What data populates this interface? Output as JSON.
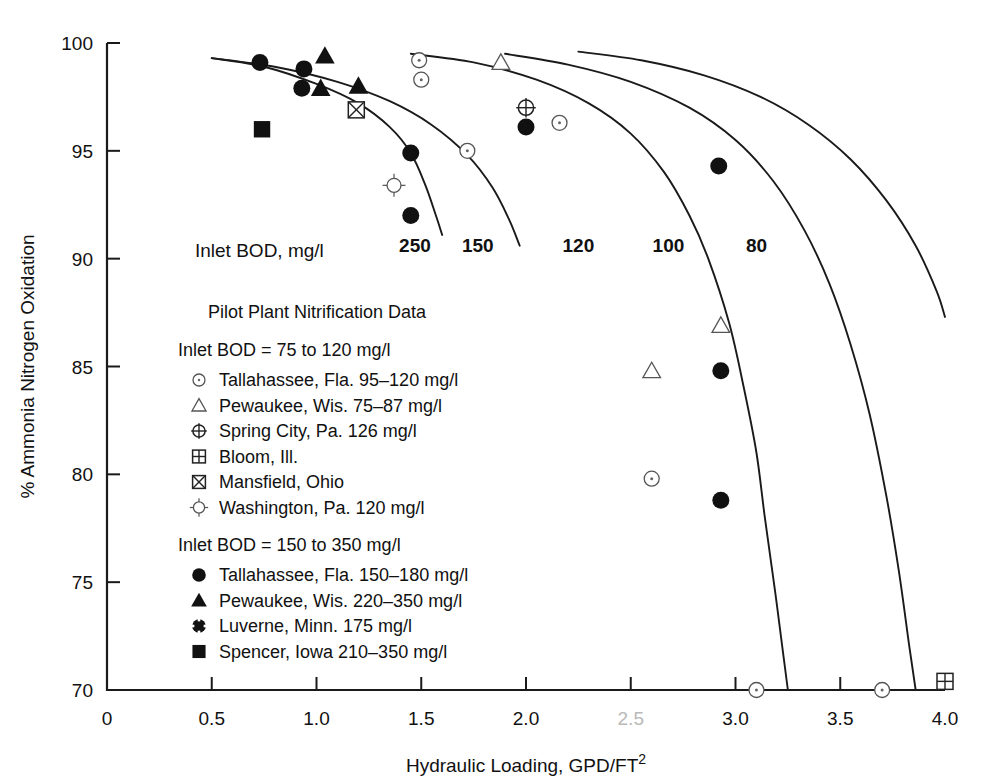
{
  "chart_data": {
    "type": "scatter",
    "title": "",
    "xlabel": "Hydraulic Loading, GPD/FT2",
    "xlabel_main": "Hydraulic Loading, GPD/FT",
    "xlabel_sup": "2",
    "ylabel": "% Ammonia Nitrogen Oxidation",
    "xlim": [
      0,
      4.0
    ],
    "ylim": [
      70,
      100
    ],
    "grid": false,
    "legend_position": "inside-left",
    "xticks": [
      {
        "value": 0,
        "label": "0",
        "faded": false
      },
      {
        "value": 0.5,
        "label": "0.5",
        "faded": false
      },
      {
        "value": 1.0,
        "label": "1.0",
        "faded": false
      },
      {
        "value": 1.5,
        "label": "1.5",
        "faded": false
      },
      {
        "value": 2.0,
        "label": "2.0",
        "faded": false
      },
      {
        "value": 2.5,
        "label": "2.5",
        "faded": true
      },
      {
        "value": 3.0,
        "label": "3.0",
        "faded": false
      },
      {
        "value": 3.5,
        "label": "3.5",
        "faded": false
      },
      {
        "value": 4.0,
        "label": "4.0",
        "faded": false
      }
    ],
    "yticks": [
      {
        "value": 70,
        "label": "70"
      },
      {
        "value": 75,
        "label": "75"
      },
      {
        "value": 80,
        "label": "80"
      },
      {
        "value": 85,
        "label": "85"
      },
      {
        "value": 90,
        "label": "90"
      },
      {
        "value": 95,
        "label": "95"
      },
      {
        "value": 100,
        "label": "100"
      }
    ],
    "curve_caption": "Inlet BOD, mg/l",
    "curves": [
      {
        "name": "250",
        "label": "250",
        "label_pos": {
          "x": 1.47,
          "y": 90.3
        },
        "points": [
          [
            0.5,
            99.3
          ],
          [
            0.75,
            98.9
          ],
          [
            1.0,
            98.1
          ],
          [
            1.2,
            97.2
          ],
          [
            1.35,
            96.1
          ],
          [
            1.45,
            94.9
          ],
          [
            1.52,
            93.4
          ],
          [
            1.57,
            92.0
          ],
          [
            1.6,
            91.1
          ]
        ]
      },
      {
        "name": "150",
        "label": "150",
        "label_pos": {
          "x": 1.77,
          "y": 90.3
        },
        "points": [
          [
            0.5,
            99.3
          ],
          [
            0.8,
            98.9
          ],
          [
            1.1,
            98.2
          ],
          [
            1.35,
            97.3
          ],
          [
            1.55,
            96.2
          ],
          [
            1.72,
            94.8
          ],
          [
            1.84,
            93.3
          ],
          [
            1.92,
            91.8
          ],
          [
            1.97,
            90.6
          ]
        ]
      },
      {
        "name": "120",
        "label": "120",
        "label_pos": {
          "x": 2.25,
          "y": 90.3
        },
        "points": [
          [
            1.45,
            99.5
          ],
          [
            1.75,
            99.1
          ],
          [
            2.05,
            98.3
          ],
          [
            2.3,
            97.2
          ],
          [
            2.5,
            95.8
          ],
          [
            2.66,
            94.0
          ],
          [
            2.78,
            92.0
          ],
          [
            2.87,
            90.0
          ],
          [
            2.97,
            87.0
          ],
          [
            3.04,
            84.0
          ],
          [
            3.1,
            81.0
          ],
          [
            3.14,
            78.0
          ],
          [
            3.19,
            74.5
          ],
          [
            3.23,
            71.5
          ],
          [
            3.25,
            70.0
          ]
        ]
      },
      {
        "name": "100",
        "label": "100",
        "label_pos": {
          "x": 2.68,
          "y": 90.3
        },
        "points": [
          [
            1.9,
            99.5
          ],
          [
            2.2,
            99.0
          ],
          [
            2.5,
            98.2
          ],
          [
            2.78,
            97.0
          ],
          [
            3.0,
            95.5
          ],
          [
            3.18,
            93.6
          ],
          [
            3.33,
            91.3
          ],
          [
            3.45,
            88.8
          ],
          [
            3.55,
            86.0
          ],
          [
            3.64,
            82.8
          ],
          [
            3.72,
            79.0
          ],
          [
            3.78,
            75.5
          ],
          [
            3.83,
            72.0
          ],
          [
            3.86,
            70.0
          ]
        ]
      },
      {
        "name": "80",
        "label": "80",
        "label_pos": {
          "x": 3.1,
          "y": 90.3
        },
        "points": [
          [
            2.25,
            99.6
          ],
          [
            2.55,
            99.2
          ],
          [
            2.85,
            98.5
          ],
          [
            3.12,
            97.5
          ],
          [
            3.35,
            96.2
          ],
          [
            3.55,
            94.6
          ],
          [
            3.72,
            92.7
          ],
          [
            3.86,
            90.6
          ],
          [
            3.96,
            88.5
          ],
          [
            4.0,
            87.3
          ]
        ]
      }
    ],
    "series": [
      {
        "name": "Tallahassee, Fla. 95–120 mg/l",
        "marker": "circle-dot",
        "group": "low",
        "points": [
          [
            1.49,
            99.2
          ],
          [
            1.5,
            98.3
          ],
          [
            1.72,
            95.0
          ],
          [
            2.16,
            96.3
          ],
          [
            2.6,
            79.8
          ],
          [
            3.1,
            70.0
          ],
          [
            3.7,
            70.0
          ]
        ]
      },
      {
        "name": "Pewaukee, Wis. 75–87 mg/l",
        "marker": "triangle-open",
        "group": "low",
        "points": [
          [
            1.88,
            99.1
          ],
          [
            2.6,
            84.8
          ],
          [
            2.93,
            86.9
          ]
        ]
      },
      {
        "name": "Spring City, Pa. 126 mg/l",
        "marker": "circle-cross",
        "group": "low",
        "points": [
          [
            2.0,
            97.0
          ]
        ]
      },
      {
        "name": "Bloom, Ill.",
        "marker": "square-grid",
        "group": "low",
        "points": [
          [
            4.0,
            70.4
          ]
        ]
      },
      {
        "name": "Mansfield, Ohio",
        "marker": "square-x",
        "group": "low",
        "points": [
          [
            1.19,
            96.9
          ]
        ]
      },
      {
        "name": "Washington, Pa. 120 mg/l",
        "marker": "circle-ticks",
        "group": "low",
        "points": [
          [
            1.37,
            93.4
          ]
        ]
      },
      {
        "name": "Tallahassee, Fla. 150–180 mg/l",
        "marker": "circle-filled",
        "group": "high",
        "points": [
          [
            0.73,
            99.1
          ],
          [
            0.94,
            98.8
          ],
          [
            0.93,
            97.9
          ],
          [
            1.45,
            94.9
          ],
          [
            1.45,
            92.0
          ],
          [
            2.0,
            96.1
          ],
          [
            2.92,
            94.3
          ],
          [
            2.93,
            84.8
          ],
          [
            2.93,
            78.8
          ]
        ]
      },
      {
        "name": "Pewaukee, Wis. 220–350 mg/l",
        "marker": "triangle-filled",
        "group": "high",
        "points": [
          [
            1.04,
            99.4
          ],
          [
            1.02,
            97.9
          ],
          [
            1.2,
            98.0
          ]
        ]
      },
      {
        "name": "Luverne, Minn. 175 mg/l",
        "marker": "circle-notched",
        "group": "high",
        "points": []
      },
      {
        "name": "Spencer, Iowa 210–350 mg/l",
        "marker": "square-filled",
        "group": "high",
        "points": [
          [
            0.74,
            96.0
          ]
        ]
      }
    ]
  },
  "legend": {
    "title": "Pilot Plant Nitrification Data",
    "groups": [
      {
        "heading": "Inlet BOD = 75 to 120 mg/l",
        "items": [
          {
            "marker": "circle-dot",
            "label": "Tallahassee, Fla. 95–120 mg/l"
          },
          {
            "marker": "triangle-open",
            "label": "Pewaukee, Wis. 75–87 mg/l"
          },
          {
            "marker": "circle-cross",
            "label": "Spring City, Pa. 126 mg/l"
          },
          {
            "marker": "square-grid",
            "label": "Bloom, Ill."
          },
          {
            "marker": "square-x",
            "label": "Mansfield, Ohio"
          },
          {
            "marker": "circle-ticks",
            "label": "Washington, Pa. 120 mg/l"
          }
        ]
      },
      {
        "heading": "Inlet BOD = 150 to 350 mg/l",
        "items": [
          {
            "marker": "circle-filled",
            "label": "Tallahassee, Fla. 150–180 mg/l"
          },
          {
            "marker": "triangle-filled",
            "label": "Pewaukee, Wis. 220–350 mg/l"
          },
          {
            "marker": "circle-notched",
            "label": "Luverne, Minn. 175 mg/l"
          },
          {
            "marker": "square-filled",
            "label": "Spencer, Iowa 210–350 mg/l"
          }
        ]
      }
    ]
  },
  "colors": {
    "ink": "#111111",
    "faded_tick": "#b9b9b9",
    "open_marker_stroke": "#555555"
  }
}
